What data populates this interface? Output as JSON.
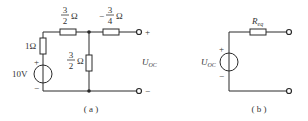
{
  "circuit_a": {
    "caption": "( a )",
    "source": {
      "value": "10V",
      "plus": "+",
      "minus": "−"
    },
    "r_series": {
      "value": "1Ω"
    },
    "r_top_left": {
      "num": "3",
      "den": "2",
      "unit": "Ω"
    },
    "r_top_right": {
      "sign": "−",
      "num": "3",
      "den": "4",
      "unit": "Ω"
    },
    "r_shunt": {
      "num": "3",
      "den": "2",
      "unit": "Ω"
    },
    "terminal_plus": "+",
    "terminal_minus": "−",
    "output_label": {
      "main": "U",
      "sub": "OC"
    }
  },
  "circuit_b": {
    "caption": "( b )",
    "source": {
      "main": "U",
      "sub": "OC",
      "plus": "+",
      "minus": "−"
    },
    "resistor": {
      "main": "R",
      "sub": "eq"
    }
  }
}
